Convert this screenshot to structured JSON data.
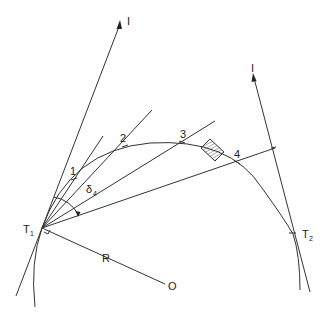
{
  "diagram": {
    "labels": {
      "intersection_left": "I",
      "intersection_right": "I",
      "tangent_point_1": "T",
      "tangent_point_1_sub": "1",
      "tangent_point_2": "T",
      "tangent_point_2_sub": "2",
      "radius": "R",
      "centre": "O",
      "angle": "δ",
      "angle_sub": "4",
      "points": [
        "1",
        "2",
        "3",
        "4"
      ]
    },
    "colors": {
      "line": "#333333",
      "background": "#ffffff"
    }
  }
}
